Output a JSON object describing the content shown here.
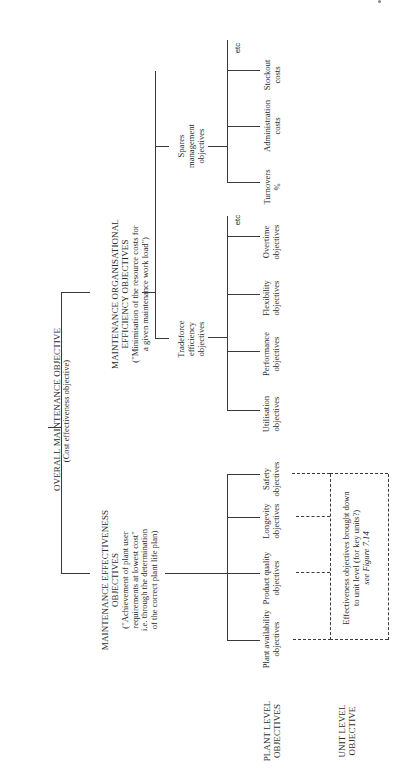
{
  "diagram": {
    "root": {
      "title": "OVERALL MAINTENANCE OBJECTIVE",
      "subtitle": "(Cost effectiveness objective)"
    },
    "branches": {
      "effectiveness": {
        "title_1": "MAINTENANCE EFFECTIVENESS",
        "title_2": "OBJECTIVES",
        "desc_1": "(\"Achievement of plant user",
        "desc_2": "requirements at lowest cost\"",
        "desc_3": "i.e. through the determination",
        "desc_4": "of the correct plant life plan)",
        "children": [
          {
            "l1": "Plant availability",
            "l2": "objectives"
          },
          {
            "l1": "Product quality",
            "l2": "objectives"
          },
          {
            "l1": "Longevity",
            "l2": "objectives"
          },
          {
            "l1": "Safety",
            "l2": "objectives"
          }
        ]
      },
      "efficiency": {
        "title_1": "MAINTENANCE ORGANISATIONAL",
        "title_2": "EFFICIENCY OBJECTIVES",
        "desc_1": "(\"Minimisation of the resource costs for",
        "desc_2": "a given maintenance work load\")",
        "tradeforce": {
          "l1": "Tradeforce",
          "l2": "efficiency",
          "l3": "objectives",
          "children": [
            {
              "l1": "Utilisation",
              "l2": "objectives"
            },
            {
              "l1": "Performance",
              "l2": "objectives"
            },
            {
              "l1": "Flexibility",
              "l2": "objectives"
            },
            {
              "l1": "Overtime",
              "l2": "objectives"
            },
            {
              "l1": "etc",
              "l2": ""
            }
          ]
        },
        "spares": {
          "l1": "Spares",
          "l2": "management",
          "l3": "objectives",
          "children": [
            {
              "l1": "Turnovers",
              "l2": "%"
            },
            {
              "l1": "Administration",
              "l2": "costs"
            },
            {
              "l1": "Stockout",
              "l2": "costs"
            },
            {
              "l1": "etc",
              "l2": ""
            }
          ]
        }
      }
    },
    "unit_box": {
      "l1": "Effectiveness objectives brought down",
      "l2": "to unit level (for key units?)",
      "l3": "see Figure 7.14"
    },
    "row_labels": {
      "plant_1": "PLANT LEVEL",
      "plant_2": "OBJECTIVES",
      "unit_1": "UNIT LEVEL",
      "unit_2": "OBJECTIVE"
    }
  }
}
